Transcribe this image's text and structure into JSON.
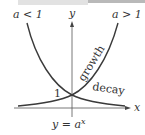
{
  "header": {
    "bar": "partial-gray-strip"
  },
  "diagram": {
    "formula_label": "y = a",
    "formula_exponent": "x",
    "axis_x_label": "x",
    "axis_y_label": "y",
    "intercept_label": "1",
    "curve_growth": {
      "condition": "a > 1",
      "label": "growth"
    },
    "curve_decay": {
      "condition": "a < 1",
      "label": "decay"
    },
    "colors": {
      "curve": "#3a3a3a",
      "axis": "#555555",
      "text": "#333333"
    }
  }
}
